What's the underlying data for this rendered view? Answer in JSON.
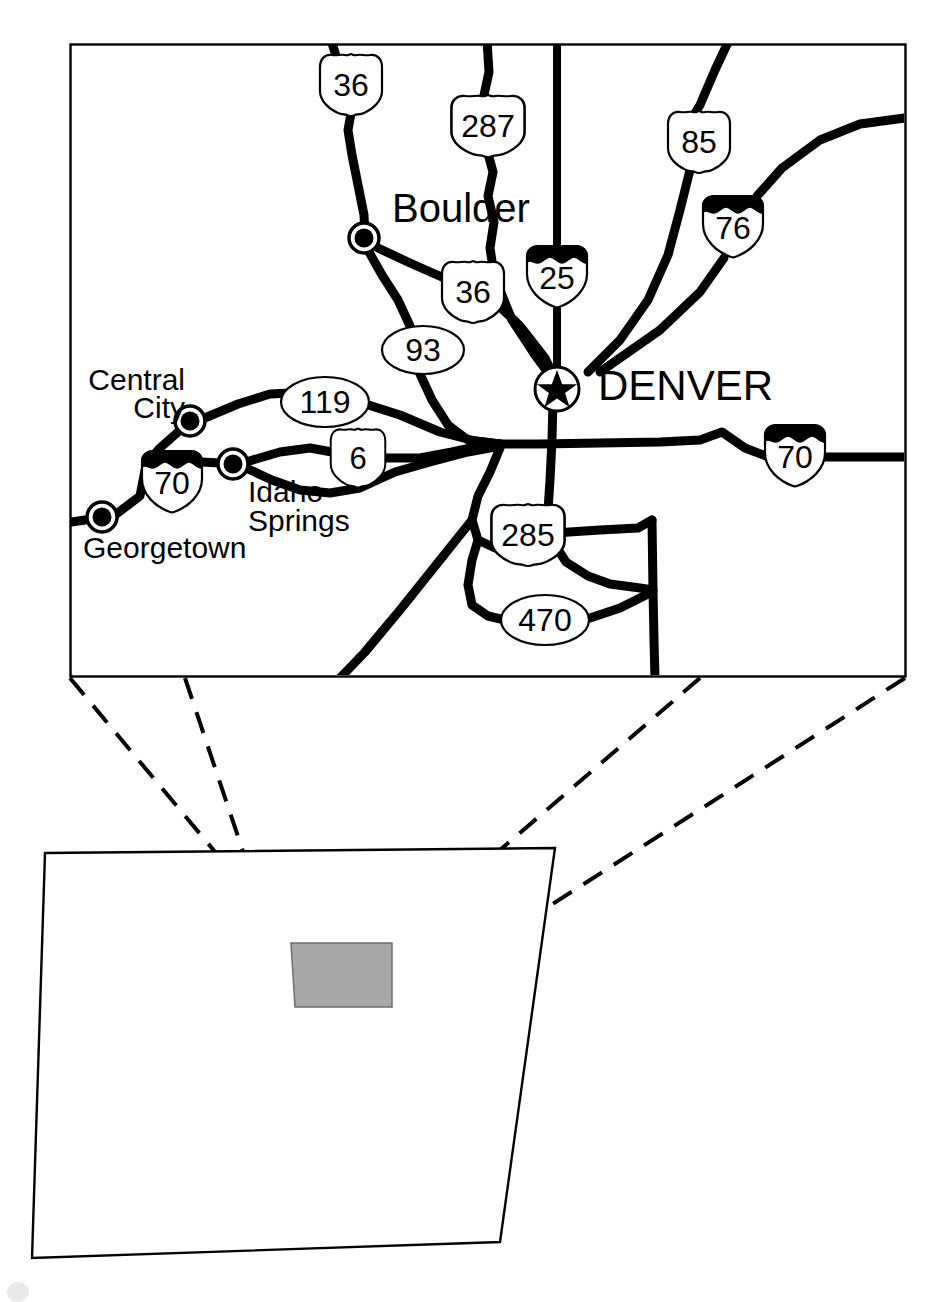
{
  "figure": {
    "type": "locator-map",
    "background_color": "#ffffff",
    "line_color": "#000000",
    "highlight_fill": "#a8a8a8"
  },
  "detail_map": {
    "name": "denver-metro-detail-map",
    "frame": {
      "x": 70,
      "y": 44,
      "width": 835,
      "height": 632
    },
    "cities": [
      {
        "name": "Boulder",
        "label": "Boulder",
        "label_x": 392,
        "label_y": 222,
        "anchor": "start",
        "font_size": 40,
        "marker_x": 364,
        "marker_y": 238
      },
      {
        "name": "Denver",
        "label": "DENVER",
        "label_x": 598,
        "label_y": 400,
        "anchor": "start",
        "font_size": 42,
        "marker_x": 557,
        "marker_y": 389,
        "capital": true
      },
      {
        "name": "Central City",
        "label": "Central City",
        "label_x": 185,
        "label_y": 390,
        "anchor": "end",
        "font_size": 30,
        "marker_x": 190,
        "marker_y": 421
      },
      {
        "name": "Idaho Springs",
        "label": "Idaho Springs",
        "label_x": 248,
        "label_y": 502,
        "anchor": "start",
        "font_size": 30,
        "marker_x": 233,
        "marker_y": 464
      },
      {
        "name": "Georgetown",
        "label": "Georgetown",
        "label_x": 83,
        "label_y": 558,
        "anchor": "start",
        "font_size": 30,
        "marker_x": 102,
        "marker_y": 517
      }
    ],
    "city_label_lines": {
      "Central City": [
        "Central",
        "City"
      ],
      "Idaho Springs": [
        "Idaho",
        "Springs"
      ]
    },
    "route_markers": [
      {
        "number": "36",
        "type": "us",
        "x": 351,
        "y": 85,
        "rx": 30,
        "ry": 31
      },
      {
        "number": "287",
        "type": "us",
        "x": 488,
        "y": 126,
        "rx": 36,
        "ry": 31
      },
      {
        "number": "85",
        "type": "us",
        "x": 699,
        "y": 142,
        "rx": 31,
        "ry": 31
      },
      {
        "number": "76",
        "type": "interstate",
        "x": 733,
        "y": 226,
        "rx": 30,
        "ry": 31
      },
      {
        "number": "25",
        "type": "interstate",
        "x": 557,
        "y": 276,
        "rx": 30,
        "ry": 31
      },
      {
        "number": "36",
        "type": "us",
        "x": 473,
        "y": 292,
        "rx": 30,
        "ry": 31
      },
      {
        "number": "93",
        "type": "state",
        "x": 423,
        "y": 350,
        "rx": 41,
        "ry": 24
      },
      {
        "number": "119",
        "type": "state",
        "x": 325,
        "y": 402,
        "rx": 44,
        "ry": 25
      },
      {
        "number": "6",
        "type": "us",
        "x": 358,
        "y": 458,
        "rx": 26,
        "ry": 29
      },
      {
        "number": "70",
        "type": "interstate",
        "x": 172,
        "y": 481,
        "rx": 30,
        "ry": 31
      },
      {
        "number": "70",
        "type": "interstate",
        "x": 795,
        "y": 455,
        "rx": 30,
        "ry": 31
      },
      {
        "number": "285",
        "type": "us",
        "x": 528,
        "y": 535,
        "rx": 36,
        "ry": 31
      },
      {
        "number": "470",
        "type": "state",
        "x": 545,
        "y": 620,
        "rx": 44,
        "ry": 25
      }
    ],
    "road_count": 14
  },
  "locator_inset": {
    "name": "colorado-state-locator",
    "state_outline": [
      [
        45,
        853
      ],
      [
        555,
        848
      ],
      [
        500,
        1242
      ],
      [
        32,
        1258
      ]
    ],
    "highlight_box": [
      [
        291,
        943
      ],
      [
        392,
        943
      ],
      [
        392,
        1007
      ],
      [
        295,
        1007
      ]
    ],
    "connector_lines": [
      {
        "from": [
          70,
          676
        ],
        "to": [
          291,
          943
        ]
      },
      {
        "from": [
          185,
          676
        ],
        "to": [
          295,
          1007
        ]
      },
      {
        "from": [
          700,
          676
        ],
        "to": [
          392,
          943
        ]
      },
      {
        "from": [
          905,
          676
        ],
        "to": [
          392,
          1007
        ]
      }
    ],
    "connector_style": "dashed"
  }
}
